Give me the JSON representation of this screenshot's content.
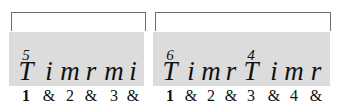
{
  "measures": [
    {
      "beats": [
        {
          "stroke": "T",
          "num": "5",
          "count": "1",
          "bold": true
        },
        {
          "stroke": "i",
          "num": "",
          "count": "&"
        },
        {
          "stroke": "m",
          "num": "",
          "count": "2"
        },
        {
          "stroke": "r",
          "num": "",
          "count": "&"
        },
        {
          "stroke": "m",
          "num": "",
          "count": "3"
        },
        {
          "stroke": "i",
          "num": "",
          "count": "&"
        }
      ]
    },
    {
      "beats": [
        {
          "stroke": "T",
          "num": "6",
          "count": "1",
          "bold": true
        },
        {
          "stroke": "i",
          "num": "",
          "count": "&"
        },
        {
          "stroke": "m",
          "num": "",
          "count": "2"
        },
        {
          "stroke": "r",
          "num": "",
          "count": "&"
        },
        {
          "stroke": "T",
          "num": "4",
          "count": "3"
        },
        {
          "stroke": "i",
          "num": "",
          "count": "&"
        },
        {
          "stroke": "m",
          "num": "",
          "count": "4"
        },
        {
          "stroke": "r",
          "num": "",
          "count": "&"
        }
      ]
    }
  ],
  "colors": {
    "band": "#dcdcdc",
    "bracket": "#6e6e6e"
  }
}
